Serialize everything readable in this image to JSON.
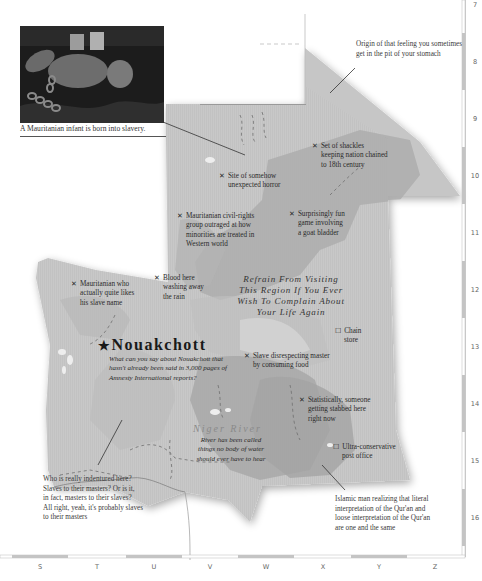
{
  "photo": {
    "caption": "A Mauritanian infant is born into slavery."
  },
  "callouts": {
    "stomach": "Origin of that feeling you sometimes get in the pit of your stomach",
    "indentured": [
      "Who is really indentured here?",
      "Slaves to their masters? Or is it,",
      "in fact, masters to their slaves?",
      "All right, yeah, it's probably slaves",
      "to their masters"
    ],
    "quran": [
      "Islamic man realizing that literal",
      "interpretation of the Qur'an and",
      "loose interpretation of the Qur'an",
      "are one and the same"
    ]
  },
  "markers": [
    {
      "symbol": "✕",
      "lines": [
        "Set of shackles",
        "keeping nation chained",
        "to 18th century"
      ]
    },
    {
      "symbol": "✕",
      "lines": [
        "Site of somehow",
        "unexpected horror"
      ]
    },
    {
      "symbol": "✕",
      "lines": [
        "Mauritanian civil-rights",
        "group outraged at how",
        "minorities are treated in",
        "Western world"
      ]
    },
    {
      "symbol": "✕",
      "lines": [
        "Surprisingly fun",
        "game involving",
        "a goat bladder"
      ]
    },
    {
      "symbol": "✕",
      "lines": [
        "Mauritanian who",
        "actually quite likes",
        "his slave name"
      ]
    },
    {
      "symbol": "✕",
      "lines": [
        "Blood here",
        "washing away",
        "the rain"
      ]
    },
    {
      "symbol": "☐",
      "lines": [
        "Chain",
        "store"
      ]
    },
    {
      "symbol": "✕",
      "lines": [
        "Slave disrespecting master",
        "by consuming food"
      ]
    },
    {
      "symbol": "✕",
      "lines": [
        "Statistically, someone",
        "getting stabbed here",
        "right now"
      ]
    },
    {
      "symbol": "☐",
      "lines": [
        "Ultra-conservative",
        "post office"
      ]
    }
  ],
  "region_title": [
    "Refrain From Visiting",
    "This Region If You Ever",
    "Wish To Complain About",
    "Your Life Again"
  ],
  "capital": {
    "symbol": "★",
    "name": "Nouakchott",
    "description": [
      "What can you say about Nouakchott that",
      "hasn't already been said in 3,000 pages of",
      "Amnesty International reports?"
    ]
  },
  "river": {
    "name": "Niger River",
    "note": [
      "River has been called",
      "things no body of water",
      "should ever have to hear"
    ]
  },
  "grid": {
    "columns": [
      "S",
      "T",
      "U",
      "V",
      "W",
      "X",
      "Y",
      "Z"
    ],
    "rows": [
      "7",
      "8",
      "9",
      "10",
      "11",
      "12",
      "13",
      "14",
      "15",
      "16"
    ]
  },
  "colors": {
    "land": "#c9c9c9",
    "land_dark": "#a9a9a9",
    "land_light": "#dcdcdc",
    "border_stripe": "#c4c4c4"
  }
}
